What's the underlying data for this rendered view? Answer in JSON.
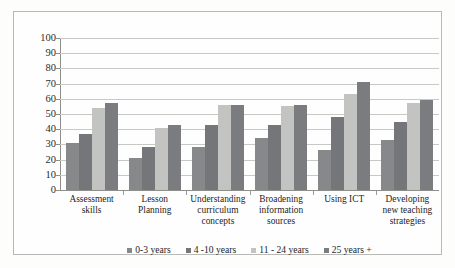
{
  "chart_data": {
    "type": "bar",
    "title": "",
    "subtitle": "",
    "xlabel": "",
    "ylabel": "",
    "ylim": [
      0,
      100
    ],
    "ytick_step": 10,
    "yticks": [
      100,
      90,
      80,
      70,
      60,
      50,
      40,
      30,
      20,
      10,
      0
    ],
    "grid": true,
    "grid_orientation": "horizontal",
    "legend_position": "bottom-center",
    "orientation": "vertical",
    "grouping": "clustered",
    "categories": [
      "Assessment skills",
      "Lesson Planning",
      "Understanding curriculum concepts",
      "Broadening information sources",
      "Using ICT",
      "Developing new teaching strategies"
    ],
    "category_lines": [
      [
        "Assessment",
        "skills"
      ],
      [
        "Lesson",
        "Planning"
      ],
      [
        "Understanding",
        "curriculum",
        "concepts"
      ],
      [
        "Broadening",
        "information",
        "sources"
      ],
      [
        "Using ICT"
      ],
      [
        "Developing",
        "new teaching",
        "strategies"
      ]
    ],
    "series": [
      {
        "name": "0-3 years",
        "color": "#87888a",
        "values": [
          31,
          21,
          28,
          34,
          26,
          33
        ]
      },
      {
        "name": "4 -10 years",
        "color": "#75767a",
        "values": [
          37,
          28,
          43,
          43,
          48,
          45
        ]
      },
      {
        "name": "11 - 24 years",
        "color": "#c3c4c2",
        "values": [
          54,
          41,
          56,
          55,
          63,
          57
        ]
      },
      {
        "name": "25 years +",
        "color": "#7b7c80",
        "values": [
          57,
          43,
          56,
          56,
          71,
          59
        ]
      }
    ]
  },
  "colors": {
    "frame_border": "#b9b9b6",
    "gridline": "#c8c8c4",
    "axis": "#8e8e8a",
    "background": "#fefefe",
    "text": "#1f1f1f"
  }
}
